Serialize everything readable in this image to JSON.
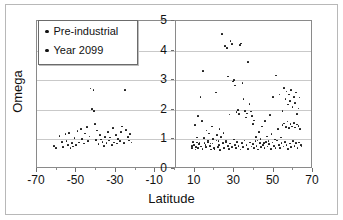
{
  "chart_data": {
    "type": "scatter",
    "title": "",
    "xlabel": "Latitude",
    "ylabel": "Omega",
    "xlim": [
      -70,
      70
    ],
    "ylim": [
      0,
      5
    ],
    "xticks": [
      -70,
      -50,
      -30,
      -10,
      10,
      30,
      50,
      70
    ],
    "xtick_labels": [
      "-70",
      "-50",
      "-30",
      "-10",
      "10",
      "30",
      "50",
      "70"
    ],
    "yticks": [
      0,
      1,
      2,
      3,
      4,
      5
    ],
    "ytick_labels": [
      "0",
      "1",
      "2",
      "3",
      "4",
      "5"
    ],
    "grid": "horizontal",
    "legend_position": "top-left",
    "series": [
      {
        "name": "Pre-industrial",
        "marker": "dot",
        "color": "#111111",
        "points": [
          [
            -61.5,
            0.78
          ],
          [
            -60.2,
            0.72
          ],
          [
            -58.6,
            1.12
          ],
          [
            -57.4,
            0.92
          ],
          [
            -56.8,
            0.74
          ],
          [
            -55.5,
            1.18
          ],
          [
            -55.0,
            0.95
          ],
          [
            -54.2,
            0.8
          ],
          [
            -53.6,
            1.22
          ],
          [
            -53.0,
            0.7
          ],
          [
            -52.4,
            0.88
          ],
          [
            -51.8,
            0.76
          ],
          [
            -50.9,
            1.05
          ],
          [
            -50.2,
            0.82
          ],
          [
            -49.4,
            1.28
          ],
          [
            -48.6,
            0.9
          ],
          [
            -47.8,
            1.34
          ],
          [
            -47.0,
            1.02
          ],
          [
            -46.2,
            0.86
          ],
          [
            -45.5,
            1.2
          ],
          [
            -44.8,
            1.42
          ],
          [
            -44.0,
            0.94
          ],
          [
            -43.4,
            1.1
          ],
          [
            -42.8,
            2.72
          ],
          [
            -42.0,
            2.02
          ],
          [
            -41.4,
            2.66
          ],
          [
            -41.0,
            1.96
          ],
          [
            -40.5,
            1.52
          ],
          [
            -40.0,
            0.98
          ],
          [
            -39.4,
            1.3
          ],
          [
            -38.8,
            0.84
          ],
          [
            -38.0,
            1.16
          ],
          [
            -37.4,
            1.0
          ],
          [
            -36.8,
            0.92
          ],
          [
            -36.0,
            0.78
          ],
          [
            -35.4,
            1.08
          ],
          [
            -34.8,
            0.88
          ],
          [
            -34.0,
            1.24
          ],
          [
            -33.4,
            0.96
          ],
          [
            -32.8,
            1.06
          ],
          [
            -32.0,
            0.82
          ],
          [
            -31.4,
            1.38
          ],
          [
            -30.8,
            0.9
          ],
          [
            -30.0,
            1.14
          ],
          [
            -29.4,
            0.86
          ],
          [
            -28.8,
            1.02
          ],
          [
            -28.0,
            0.94
          ],
          [
            -27.4,
            1.26
          ],
          [
            -26.8,
            1.44
          ],
          [
            -26.0,
            0.88
          ],
          [
            -25.4,
            2.68
          ],
          [
            -24.8,
            1.32
          ],
          [
            -24.0,
            1.08
          ],
          [
            -23.4,
            0.96
          ],
          [
            -22.8,
            1.18
          ],
          [
            -22.0,
            0.9
          ],
          [
            8.5,
            0.78
          ],
          [
            9.2,
            0.92
          ],
          [
            10.0,
            1.48
          ],
          [
            10.6,
            0.74
          ],
          [
            11.2,
            1.06
          ],
          [
            11.8,
            1.78
          ],
          [
            12.4,
            0.88
          ],
          [
            13.0,
            2.44
          ],
          [
            13.6,
            1.62
          ],
          [
            14.2,
            3.32
          ],
          [
            14.8,
            1.04
          ],
          [
            15.4,
            0.82
          ],
          [
            16.0,
            1.3
          ],
          [
            16.6,
            0.96
          ],
          [
            17.2,
            1.2
          ],
          [
            18.0,
            0.86
          ],
          [
            18.6,
            1.44
          ],
          [
            19.2,
            1.02
          ],
          [
            20.0,
            0.68
          ],
          [
            20.8,
            2.58
          ],
          [
            21.4,
            1.16
          ],
          [
            22.0,
            0.94
          ],
          [
            22.6,
            1.36
          ],
          [
            23.2,
            1.08
          ],
          [
            24.0,
            4.56
          ],
          [
            24.6,
            1.22
          ],
          [
            25.2,
            4.16
          ],
          [
            25.8,
            0.9
          ],
          [
            26.4,
            4.08
          ],
          [
            27.0,
            3.12
          ],
          [
            27.6,
            1.84
          ],
          [
            28.2,
            4.32
          ],
          [
            28.8,
            4.22
          ],
          [
            29.4,
            2.96
          ],
          [
            30.0,
            3.0
          ],
          [
            30.6,
            2.82
          ],
          [
            31.2,
            1.92
          ],
          [
            31.8,
            2.0
          ],
          [
            32.4,
            1.86
          ],
          [
            33.0,
            4.2
          ],
          [
            33.6,
            4.24
          ],
          [
            34.2,
            2.9
          ],
          [
            34.8,
            2.36
          ],
          [
            35.4,
            1.96
          ],
          [
            36.0,
            1.74
          ],
          [
            36.6,
            1.88
          ],
          [
            37.2,
            3.62
          ],
          [
            37.8,
            2.2
          ],
          [
            38.4,
            1.94
          ],
          [
            39.0,
            1.8
          ],
          [
            39.6,
            1.52
          ],
          [
            40.2,
            1.64
          ],
          [
            41.0,
            1.08
          ],
          [
            41.8,
            0.96
          ],
          [
            42.6,
            1.26
          ],
          [
            43.4,
            1.02
          ],
          [
            44.2,
            1.44
          ],
          [
            45.0,
            0.88
          ],
          [
            45.8,
            1.62
          ],
          [
            46.6,
            1.1
          ],
          [
            47.4,
            0.94
          ],
          [
            48.2,
            1.82
          ],
          [
            49.0,
            1.18
          ],
          [
            49.8,
            2.44
          ],
          [
            50.6,
            1.0
          ],
          [
            51.4,
            3.16
          ],
          [
            52.2,
            1.34
          ],
          [
            53.0,
            2.52
          ],
          [
            53.8,
            1.06
          ],
          [
            54.6,
            1.96
          ],
          [
            55.4,
            2.74
          ],
          [
            56.0,
            2.36
          ],
          [
            56.6,
            2.62
          ],
          [
            57.2,
            2.18
          ],
          [
            57.8,
            2.52
          ],
          [
            58.4,
            2.3
          ],
          [
            59.0,
            2.66
          ],
          [
            59.6,
            2.1
          ],
          [
            60.2,
            2.44
          ],
          [
            60.8,
            2.22
          ],
          [
            61.4,
            2.58
          ],
          [
            62.0,
            1.86
          ],
          [
            62.6,
            2.04
          ],
          [
            63.2,
            2.42
          ]
        ]
      },
      {
        "name": "Year 2099",
        "marker": "dot",
        "color": "#111111",
        "points": [
          [
            8.8,
            0.7
          ],
          [
            9.6,
            0.8
          ],
          [
            10.4,
            0.66
          ],
          [
            11.0,
            0.9
          ],
          [
            11.6,
            0.72
          ],
          [
            12.2,
            0.84
          ],
          [
            13.2,
            0.76
          ],
          [
            14.0,
            0.68
          ],
          [
            15.0,
            0.88
          ],
          [
            15.8,
            0.74
          ],
          [
            16.8,
            0.92
          ],
          [
            17.6,
            0.78
          ],
          [
            18.4,
            0.66
          ],
          [
            19.0,
            0.86
          ],
          [
            19.8,
            0.7
          ],
          [
            21.0,
            0.96
          ],
          [
            21.8,
            0.74
          ],
          [
            22.4,
            0.82
          ],
          [
            23.0,
            0.64
          ],
          [
            24.2,
            0.88
          ],
          [
            25.0,
            0.72
          ],
          [
            26.0,
            0.94
          ],
          [
            26.8,
            0.78
          ],
          [
            27.4,
            0.68
          ],
          [
            28.0,
            0.86
          ],
          [
            29.0,
            0.74
          ],
          [
            29.8,
            1.0
          ],
          [
            30.4,
            0.82
          ],
          [
            31.0,
            0.7
          ],
          [
            31.6,
            0.92
          ],
          [
            32.2,
            0.78
          ],
          [
            33.2,
            0.66
          ],
          [
            34.0,
            0.88
          ],
          [
            34.6,
            0.74
          ],
          [
            35.2,
            0.96
          ],
          [
            36.2,
            0.8
          ],
          [
            37.0,
            0.68
          ],
          [
            38.0,
            0.9
          ],
          [
            38.8,
            0.76
          ],
          [
            39.4,
            0.84
          ],
          [
            40.0,
            0.7
          ],
          [
            40.8,
            0.94
          ],
          [
            41.4,
            0.78
          ],
          [
            42.2,
            0.66
          ],
          [
            43.0,
            0.88
          ],
          [
            43.8,
            0.74
          ],
          [
            44.6,
            0.82
          ],
          [
            45.4,
            0.7
          ],
          [
            46.2,
            0.92
          ],
          [
            47.0,
            0.76
          ],
          [
            47.8,
            0.84
          ],
          [
            48.6,
            0.68
          ],
          [
            49.4,
            0.9
          ],
          [
            50.2,
            0.78
          ],
          [
            51.0,
            0.72
          ],
          [
            51.8,
            0.96
          ],
          [
            52.6,
            0.82
          ],
          [
            53.4,
            0.7
          ],
          [
            54.0,
            0.88
          ],
          [
            54.6,
            1.48
          ],
          [
            55.0,
            0.76
          ],
          [
            55.4,
            1.54
          ],
          [
            55.8,
            0.92
          ],
          [
            56.2,
            1.42
          ],
          [
            56.6,
            0.8
          ],
          [
            57.0,
            1.6
          ],
          [
            57.4,
            0.68
          ],
          [
            57.8,
            1.38
          ],
          [
            58.2,
            0.86
          ],
          [
            58.6,
            1.52
          ],
          [
            59.0,
            0.74
          ],
          [
            59.4,
            1.44
          ],
          [
            59.8,
            0.94
          ],
          [
            60.2,
            1.56
          ],
          [
            60.6,
            0.78
          ],
          [
            61.0,
            1.4
          ],
          [
            61.4,
            0.88
          ],
          [
            61.8,
            1.5
          ],
          [
            62.2,
            0.72
          ],
          [
            62.6,
            1.46
          ],
          [
            63.0,
            0.9
          ],
          [
            63.4,
            1.36
          ],
          [
            63.8,
            0.82
          ],
          [
            64.2,
            0.76
          ]
        ]
      }
    ]
  },
  "legend": {
    "items": [
      {
        "label": "Pre-industrial"
      },
      {
        "label": "Year 2099"
      }
    ]
  }
}
